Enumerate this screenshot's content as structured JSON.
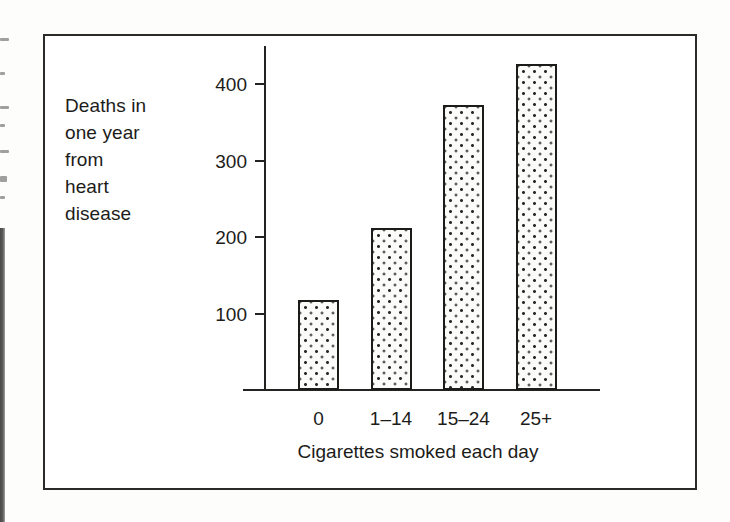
{
  "figure": {
    "type": "bar-chart-figure",
    "border_color": "#2b2b29",
    "background_color": "#ffffff"
  },
  "scan_artifacts": {
    "description": "faint partial text fragments and dark vertical bar at left page margin",
    "fragment_count": 7,
    "bar_color": "#3a3a38"
  },
  "chart_data": {
    "type": "bar",
    "title": "",
    "subtitle": "",
    "xlabel": "Cigarettes smoked each day",
    "ylabel": "Deaths in\none year\nfrom\nheart\ndisease",
    "ylabel_lines": [
      "Deaths in",
      "one year",
      "from",
      "heart",
      "disease"
    ],
    "categories": [
      "0",
      "1–14",
      "15–24",
      "25+"
    ],
    "values": [
      118,
      212,
      373,
      426
    ],
    "ylim": [
      0,
      460
    ],
    "yticks": [
      100,
      200,
      300,
      400
    ],
    "ytick_labels": [
      "100",
      "200",
      "300",
      "400"
    ],
    "grid": false,
    "legend": false,
    "legend_position": "none",
    "bar_fill": "stippled-dots",
    "bar_fill_color": "#fbfbfa",
    "bar_dot_color": "#2a2a28",
    "bar_outline_color": "#1b1b19",
    "axis_color": "#232321",
    "text_color": "#1c1c1a"
  }
}
